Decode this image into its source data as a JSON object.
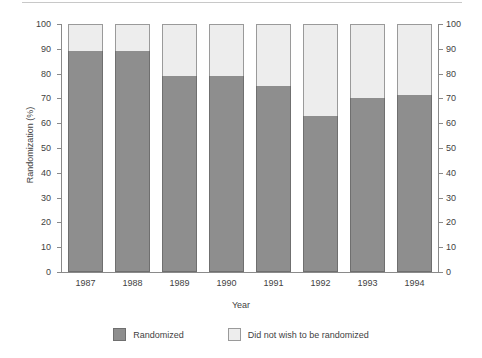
{
  "chart_data": {
    "type": "bar",
    "subtype": "stacked-percentage",
    "title": "",
    "xlabel": "Year",
    "ylabel": "Randomization (%)",
    "ylim": [
      0,
      100
    ],
    "ytick_step": 10,
    "yticks": [
      0,
      10,
      20,
      30,
      40,
      50,
      60,
      70,
      80,
      90,
      100
    ],
    "ytick_labels": [
      "0",
      "10",
      "20",
      "30",
      "40",
      "50",
      "60",
      "70",
      "80",
      "90",
      "100"
    ],
    "dual_y_axis": true,
    "grid": false,
    "legend_position": "bottom-center",
    "categories": [
      "1987",
      "1988",
      "1989",
      "1990",
      "1991",
      "1992",
      "1993",
      "1994"
    ],
    "series": [
      {
        "name": "Randomized",
        "color": "#8e8e8e",
        "border_color": "#6f6f6f",
        "values": [
          89,
          89,
          79,
          79,
          75,
          63,
          70,
          71.5
        ]
      },
      {
        "name": "Did not wish to be randomized",
        "color": "#ededed",
        "border_color": "#9a9a9a",
        "values": [
          11,
          11,
          21,
          21,
          25,
          37,
          30,
          28.5
        ]
      }
    ]
  },
  "axes": {
    "x_title": "Year",
    "y_title": "Randomization (%)",
    "y_tick_labels_left": [
      "100",
      "90",
      "80",
      "70",
      "60",
      "50",
      "40",
      "30",
      "20",
      "10",
      "0"
    ],
    "y_tick_labels_right": [
      "100",
      "90",
      "80",
      "70",
      "60",
      "50",
      "40",
      "30",
      "20",
      "10",
      "0"
    ],
    "x_tick_labels": [
      "1987",
      "1988",
      "1989",
      "1990",
      "1991",
      "1992",
      "1993",
      "1994"
    ]
  },
  "legend": {
    "entries": [
      {
        "label": "Randomized",
        "swatch": "dark-gray-swatch"
      },
      {
        "label": "Did not wish to be randomized",
        "swatch": "light-gray-swatch"
      }
    ]
  },
  "colors": {
    "randomized": "#8e8e8e",
    "not_randomized": "#ededed",
    "axis": "#8a8a8a",
    "text": "#3f3f3f",
    "background": "#ffffff"
  }
}
